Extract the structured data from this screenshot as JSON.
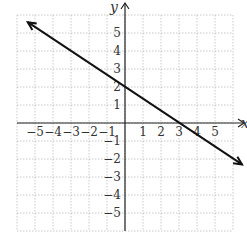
{
  "chart_data": {
    "type": "line",
    "title": "",
    "xlabel": "x",
    "ylabel": "y",
    "xlim": [
      -6,
      6
    ],
    "ylim": [
      -6,
      6
    ],
    "grid": true,
    "x_ticks": [
      "-5",
      "-4",
      "-3",
      "-2",
      "-1",
      "1",
      "2",
      "3",
      "4",
      "5"
    ],
    "y_ticks": [
      "5",
      "4",
      "3",
      "2",
      "1",
      "-1",
      "-2",
      "-3",
      "-4",
      "-5"
    ],
    "series": [
      {
        "name": "line",
        "equation": "y = -2/3 x + 2",
        "points": [
          [
            -5.4,
            5.6
          ],
          [
            0,
            2
          ],
          [
            3,
            0
          ],
          [
            6.5,
            -2.3
          ]
        ],
        "arrows": "both"
      }
    ],
    "caption": "(partially visible text, cut off)"
  }
}
